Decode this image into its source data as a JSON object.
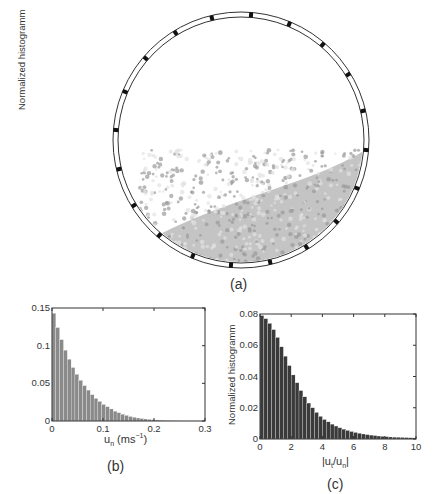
{
  "figure": {
    "panels": [
      {
        "id": "a",
        "caption": "(a)",
        "description": "Rotating drum cross-section with lifters and granular bed"
      },
      {
        "id": "b",
        "caption": "(b)"
      },
      {
        "id": "c",
        "caption": "(c)"
      }
    ],
    "drum": {
      "lifter_count": 20,
      "bed_color": "#bdbdbd"
    }
  },
  "chart_data": [
    {
      "type": "bar",
      "panel": "b",
      "title": "",
      "ylabel": "Normalized histogramm",
      "xlabel_main": "u",
      "xlabel_sub": "n",
      "xlabel_units": " (ms",
      "xlabel_sup": "−1",
      "xlabel_close": ")",
      "xlim": [
        0,
        0.3
      ],
      "ylim": [
        0,
        0.15
      ],
      "xticks": [
        "0",
        "0.1",
        "0.2",
        "0.3"
      ],
      "yticks": [
        "0",
        "0.05",
        "0.1",
        "0.15"
      ],
      "bin_width": 0.0075,
      "values": [
        0.143,
        0.124,
        0.108,
        0.094,
        0.082,
        0.071,
        0.062,
        0.054,
        0.047,
        0.041,
        0.035,
        0.03,
        0.026,
        0.022,
        0.019,
        0.016,
        0.013,
        0.011,
        0.009,
        0.0075,
        0.006,
        0.005,
        0.004,
        0.0033,
        0.0027,
        0.0022,
        0.0018,
        0.0014,
        0.0011,
        0.0009,
        0.0007,
        0.0005,
        0.0004,
        0.0003,
        0.0002,
        0.0002,
        0.0001,
        0.0001,
        0.0001,
        0.0001
      ],
      "bar_color": "#8a8a8a",
      "grid": false
    },
    {
      "type": "bar",
      "panel": "c",
      "title": "",
      "ylabel": "Normalized histogramm",
      "xlabel_main": "|u",
      "xlabel_sub1": "t",
      "xlabel_mid": "/u",
      "xlabel_sub2": "n",
      "xlabel_close": "|",
      "xlim": [
        0,
        10
      ],
      "ylim": [
        0,
        0.08
      ],
      "xticks": [
        "0",
        "2",
        "4",
        "6",
        "8",
        "10"
      ],
      "yticks": [
        "0",
        "0.02",
        "0.04",
        "0.06",
        "0.08"
      ],
      "bin_width": 0.25,
      "values": [
        0.079,
        0.077,
        0.074,
        0.07,
        0.065,
        0.059,
        0.053,
        0.047,
        0.041,
        0.036,
        0.031,
        0.027,
        0.023,
        0.02,
        0.017,
        0.0145,
        0.0125,
        0.011,
        0.0095,
        0.0083,
        0.0072,
        0.0063,
        0.0055,
        0.0048,
        0.0042,
        0.0037,
        0.0032,
        0.0028,
        0.0025,
        0.0022,
        0.0019,
        0.0017,
        0.0015,
        0.0013,
        0.0012,
        0.0011,
        0.001,
        0.0009,
        0.0008,
        0.0007
      ],
      "bar_color": "#3a3a3a",
      "grid": false
    }
  ]
}
